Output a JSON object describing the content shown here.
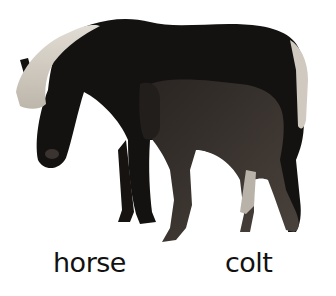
{
  "labels": {
    "horse": "horse",
    "colt": "colt"
  },
  "image": {
    "subject": "adult horse with light mane and colt standing beside it",
    "style": "grayscale photograph on white background"
  },
  "colors": {
    "background": "#ffffff",
    "horse_body": "#141210",
    "mane": "#d8d4cc",
    "colt_body": "#3a3430",
    "label_text": "#111111"
  }
}
